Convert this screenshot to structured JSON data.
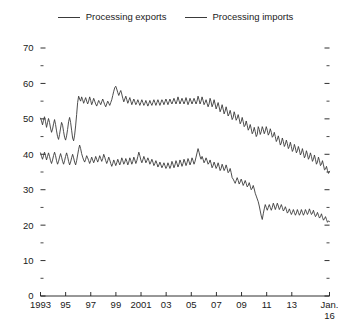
{
  "legend": {
    "position": "top-center",
    "entries": [
      {
        "label": "Processing exports",
        "color": "#3a3a3a",
        "icon": "line-swatch"
      },
      {
        "label": "Processing imports",
        "color": "#3a3a3a",
        "icon": "line-swatch"
      }
    ]
  },
  "chart_data": {
    "type": "line",
    "title": "",
    "subtitle": "",
    "xlabel": "",
    "ylabel": "",
    "grid": false,
    "ylim": [
      0,
      70
    ],
    "y_major_ticks": [
      0,
      10,
      20,
      30,
      40,
      50,
      60,
      70
    ],
    "y_minor_ticks": [
      5,
      15,
      25,
      35,
      45,
      55,
      65
    ],
    "y_tick_labels": [
      "0",
      "10",
      "20",
      "30",
      "40",
      "50",
      "60",
      "70"
    ],
    "x_tick_labels": [
      "1993",
      "95",
      "97",
      "99",
      "2001",
      "03",
      "05",
      "07",
      "09",
      "11",
      "13",
      "Jan."
    ],
    "x_tick_sublabel": "16",
    "x_tick_years": [
      1993,
      1995,
      1997,
      1999,
      2001,
      2003,
      2005,
      2007,
      2009,
      2011,
      2013,
      2016
    ],
    "x_range": [
      1993.0,
      2016.0
    ],
    "frequency": "monthly",
    "mirrored_right_ticks": true,
    "series": [
      {
        "name": "Processing exports",
        "color": "#3a3a3a",
        "start": "1993-01",
        "end": "2016-01",
        "values": [
          50.2,
          49.4,
          48.3,
          49.6,
          50.6,
          49.2,
          47.6,
          48.9,
          50.1,
          49.0,
          47.4,
          46.2,
          47.1,
          48.6,
          49.8,
          48.4,
          46.6,
          45.0,
          44.2,
          45.6,
          47.4,
          49.0,
          48.2,
          46.4,
          44.8,
          44.0,
          45.2,
          47.0,
          49.2,
          50.4,
          49.0,
          46.8,
          44.6,
          43.8,
          45.4,
          48.0,
          51.2,
          54.6,
          56.4,
          55.6,
          55.0,
          56.2,
          55.4,
          54.4,
          55.2,
          56.0,
          55.0,
          54.2,
          55.0,
          56.2,
          55.2,
          54.0,
          54.8,
          55.8,
          55.0,
          54.2,
          53.6,
          54.4,
          55.2,
          54.6,
          54.0,
          54.8,
          55.6,
          54.8,
          54.0,
          53.4,
          54.2,
          55.0,
          54.4,
          53.8,
          54.6,
          55.4,
          56.6,
          57.8,
          58.8,
          59.2,
          58.4,
          57.4,
          56.6,
          57.4,
          58.0,
          57.0,
          55.8,
          54.8,
          55.6,
          56.4,
          55.4,
          54.4,
          55.2,
          56.0,
          55.0,
          54.0,
          54.8,
          55.6,
          54.8,
          54.0,
          54.6,
          55.4,
          54.6,
          53.8,
          54.6,
          55.4,
          54.6,
          53.8,
          54.4,
          55.2,
          54.4,
          53.6,
          54.4,
          55.2,
          54.4,
          53.8,
          54.6,
          55.4,
          54.6,
          53.8,
          54.6,
          55.4,
          54.6,
          53.8,
          54.6,
          55.4,
          54.8,
          54.0,
          54.8,
          55.6,
          54.8,
          54.0,
          54.8,
          55.6,
          54.8,
          54.2,
          55.0,
          55.8,
          55.0,
          54.2,
          55.0,
          56.2,
          55.2,
          54.2,
          55.0,
          55.8,
          55.0,
          54.2,
          55.0,
          56.0,
          55.0,
          54.0,
          54.8,
          55.8,
          55.0,
          54.2,
          55.0,
          55.8,
          55.0,
          54.2,
          55.0,
          56.4,
          55.4,
          54.2,
          55.0,
          56.2,
          55.2,
          54.0,
          54.6,
          55.4,
          54.4,
          53.4,
          54.2,
          55.8,
          54.8,
          53.4,
          54.2,
          55.4,
          54.2,
          52.8,
          53.6,
          54.6,
          53.4,
          52.0,
          52.8,
          54.0,
          52.8,
          51.4,
          52.2,
          53.4,
          52.2,
          50.8,
          51.4,
          52.4,
          51.2,
          49.8,
          50.4,
          52.0,
          51.0,
          49.6,
          50.2,
          51.2,
          50.0,
          48.6,
          49.2,
          50.4,
          49.2,
          47.8,
          48.2,
          49.4,
          48.2,
          46.8,
          47.4,
          48.4,
          47.2,
          45.8,
          46.4,
          47.6,
          46.4,
          45.0,
          45.6,
          47.8,
          47.0,
          45.6,
          46.4,
          47.8,
          47.0,
          45.8,
          46.6,
          47.8,
          46.8,
          45.4,
          46.0,
          47.2,
          46.2,
          44.8,
          45.2,
          46.2,
          45.0,
          43.6,
          44.2,
          45.2,
          44.0,
          42.6,
          43.2,
          44.6,
          43.6,
          42.2,
          42.8,
          44.0,
          43.0,
          41.6,
          42.2,
          43.4,
          42.2,
          40.8,
          41.4,
          42.8,
          41.8,
          40.4,
          41.0,
          42.2,
          41.2,
          39.8,
          40.4,
          41.6,
          40.4,
          39.0,
          39.6,
          41.0,
          40.0,
          38.6,
          39.2,
          40.4,
          39.4,
          38.0,
          38.6,
          39.8,
          38.6,
          37.2,
          37.8,
          39.2,
          38.2,
          36.8,
          37.2,
          38.2,
          37.0,
          35.6,
          35.8,
          36.6,
          35.4,
          34.6,
          35.2
        ]
      },
      {
        "name": "Processing imports",
        "color": "#3a3a3a",
        "start": "1993-01",
        "end": "2016-01",
        "values": [
          40.4,
          39.4,
          38.6,
          39.6,
          40.6,
          39.6,
          38.4,
          39.4,
          40.4,
          39.4,
          38.2,
          37.4,
          38.4,
          39.6,
          40.6,
          39.6,
          38.2,
          37.2,
          38.0,
          39.2,
          40.2,
          39.2,
          38.0,
          37.2,
          38.2,
          39.4,
          40.4,
          39.4,
          38.0,
          37.0,
          37.8,
          39.0,
          40.0,
          39.0,
          37.8,
          37.0,
          38.2,
          39.8,
          41.4,
          42.6,
          41.6,
          40.2,
          39.2,
          38.4,
          37.8,
          38.6,
          39.6,
          39.0,
          38.2,
          37.4,
          38.2,
          39.2,
          38.4,
          37.6,
          38.4,
          39.4,
          38.6,
          37.8,
          38.6,
          39.6,
          38.8,
          38.0,
          38.8,
          40.0,
          39.2,
          38.2,
          37.4,
          38.2,
          39.2,
          38.4,
          37.4,
          36.6,
          37.4,
          38.4,
          37.6,
          36.8,
          37.6,
          38.6,
          37.8,
          37.0,
          37.8,
          39.0,
          38.2,
          37.2,
          37.8,
          38.8,
          38.0,
          37.0,
          37.8,
          39.0,
          38.2,
          37.2,
          38.0,
          39.2,
          38.4,
          37.4,
          38.2,
          39.4,
          40.6,
          39.6,
          38.4,
          37.6,
          38.4,
          39.4,
          38.6,
          37.6,
          38.2,
          39.0,
          38.2,
          37.2,
          37.8,
          38.6,
          37.8,
          36.8,
          37.4,
          38.2,
          37.4,
          36.4,
          37.0,
          37.8,
          37.0,
          36.2,
          36.8,
          37.6,
          36.8,
          36.0,
          36.6,
          37.6,
          36.8,
          36.0,
          36.8,
          38.0,
          37.2,
          36.2,
          37.0,
          38.2,
          37.4,
          36.4,
          37.2,
          38.4,
          37.6,
          36.6,
          37.4,
          38.6,
          37.8,
          36.8,
          37.6,
          38.8,
          38.0,
          37.0,
          37.8,
          39.0,
          38.2,
          37.2,
          38.0,
          39.2,
          40.4,
          41.6,
          40.6,
          39.4,
          38.6,
          39.4,
          38.6,
          37.6,
          38.2,
          39.0,
          38.2,
          37.2,
          37.6,
          38.4,
          37.4,
          36.2,
          36.8,
          37.8,
          37.0,
          36.0,
          36.6,
          37.6,
          36.6,
          35.4,
          36.0,
          37.2,
          36.4,
          35.4,
          36.0,
          37.0,
          36.0,
          34.8,
          35.2,
          36.0,
          34.8,
          33.4,
          33.0,
          32.4,
          31.8,
          32.6,
          33.4,
          32.6,
          31.6,
          32.2,
          33.0,
          32.2,
          31.2,
          31.8,
          32.6,
          31.8,
          30.8,
          31.2,
          32.0,
          31.0,
          30.0,
          30.4,
          31.2,
          30.2,
          29.0,
          28.2,
          27.4,
          26.6,
          25.4,
          24.0,
          22.6,
          21.6,
          23.2,
          24.6,
          25.8,
          25.0,
          24.2,
          25.0,
          25.8,
          25.0,
          24.2,
          25.0,
          26.2,
          25.4,
          24.4,
          25.2,
          26.2,
          25.4,
          24.4,
          25.0,
          25.8,
          25.0,
          24.0,
          24.4,
          25.2,
          24.4,
          23.4,
          23.8,
          24.6,
          23.8,
          23.0,
          23.6,
          24.4,
          23.6,
          22.8,
          23.4,
          24.4,
          23.6,
          22.8,
          23.4,
          24.4,
          23.6,
          22.8,
          23.4,
          24.4,
          23.8,
          23.0,
          23.6,
          24.6,
          23.8,
          23.0,
          23.4,
          24.2,
          23.2,
          22.4,
          22.8,
          23.6,
          22.8,
          22.0,
          22.4,
          23.2,
          22.2,
          21.4,
          21.8,
          22.4,
          21.6,
          20.8,
          21.2,
          21.0
        ]
      }
    ]
  }
}
